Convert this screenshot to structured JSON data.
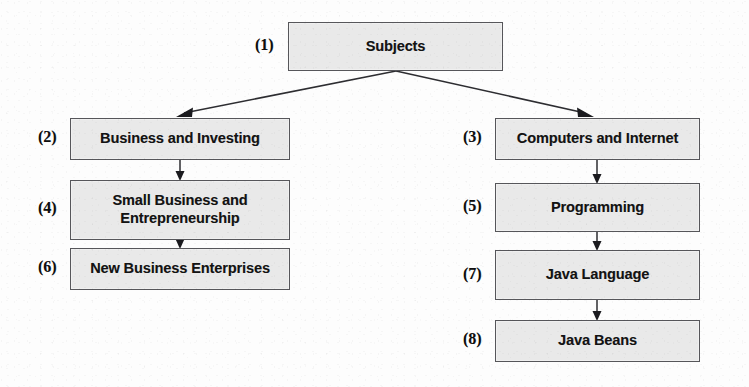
{
  "diagram": {
    "background_color": "#fdfdfd",
    "node_fill_color": "#e9e9e9",
    "node_border_color": "#56565a",
    "edge_color": "#2d2d31",
    "nodes": [
      {
        "tag": "(1)",
        "label": "Subjects",
        "name": "node-subjects"
      },
      {
        "tag": "(2)",
        "label": "Business and Investing",
        "name": "node-business-and-investing"
      },
      {
        "tag": "(3)",
        "label": "Computers and Internet",
        "name": "node-computers-and-internet"
      },
      {
        "tag": "(4)",
        "label": "Small Business and\nEntrepreneurship",
        "name": "node-small-business-and-entrepreneurship"
      },
      {
        "tag": "(5)",
        "label": "Programming",
        "name": "node-programming"
      },
      {
        "tag": "(6)",
        "label": "New Business Enterprises",
        "name": "node-new-business-enterprises"
      },
      {
        "tag": "(7)",
        "label": "Java Language",
        "name": "node-java-language"
      },
      {
        "tag": "(8)",
        "label": "Java Beans",
        "name": "node-java-beans"
      }
    ],
    "edges": [
      {
        "from": "(1)",
        "to": "(2)",
        "kind": "diagonal-down-left"
      },
      {
        "from": "(1)",
        "to": "(3)",
        "kind": "diagonal-down-right"
      },
      {
        "from": "(2)",
        "to": "(4)",
        "kind": "vertical"
      },
      {
        "from": "(4)",
        "to": "(6)",
        "kind": "vertical"
      },
      {
        "from": "(3)",
        "to": "(5)",
        "kind": "vertical"
      },
      {
        "from": "(5)",
        "to": "(7)",
        "kind": "vertical"
      },
      {
        "from": "(7)",
        "to": "(8)",
        "kind": "vertical"
      }
    ]
  }
}
